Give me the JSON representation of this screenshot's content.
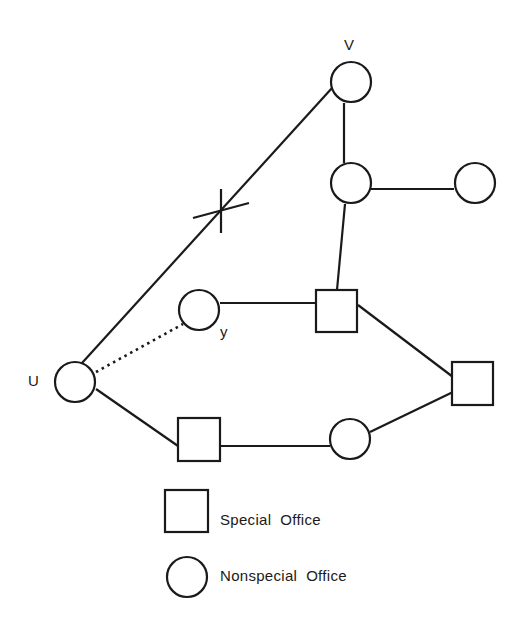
{
  "diagram": {
    "nodes": [
      {
        "id": "V",
        "shape": "circle",
        "label": "V"
      },
      {
        "id": "n2",
        "shape": "circle",
        "label": ""
      },
      {
        "id": "n3",
        "shape": "circle",
        "label": ""
      },
      {
        "id": "y",
        "shape": "circle",
        "label": "y"
      },
      {
        "id": "s1",
        "shape": "square",
        "label": ""
      },
      {
        "id": "U",
        "shape": "circle",
        "label": "U"
      },
      {
        "id": "s2",
        "shape": "square",
        "label": ""
      },
      {
        "id": "s3",
        "shape": "square",
        "label": ""
      },
      {
        "id": "n4",
        "shape": "circle",
        "label": ""
      }
    ],
    "edges": [
      {
        "from": "U",
        "to": "V",
        "style": "solid",
        "marked_cut": true
      },
      {
        "from": "V",
        "to": "n2",
        "style": "solid"
      },
      {
        "from": "n2",
        "to": "n3",
        "style": "solid"
      },
      {
        "from": "n2",
        "to": "s1",
        "style": "solid"
      },
      {
        "from": "y",
        "to": "s1",
        "style": "solid"
      },
      {
        "from": "U",
        "to": "y",
        "style": "dotted"
      },
      {
        "from": "s1",
        "to": "s2",
        "style": "solid"
      },
      {
        "from": "U",
        "to": "s3",
        "style": "solid"
      },
      {
        "from": "s3",
        "to": "n4",
        "style": "solid"
      },
      {
        "from": "n4",
        "to": "s2",
        "style": "solid"
      }
    ],
    "labels": {
      "V": "V",
      "U": "U",
      "y": "y"
    },
    "legend": {
      "special": "Special  Office",
      "nonspecial": "Nonspecial  Office"
    }
  }
}
